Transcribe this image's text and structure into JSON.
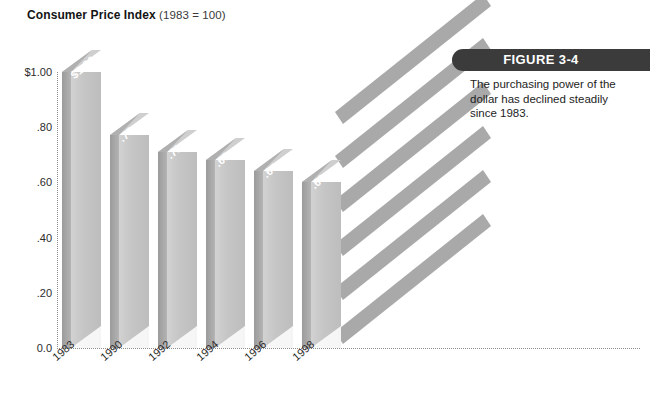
{
  "title": {
    "main": "Consumer Price Index",
    "sub": "(1983 = 100)"
  },
  "figure": {
    "banner_label": "FIGURE 3-4",
    "caption": "The purchasing power of the dollar has declined steadily since 1983.",
    "banner_color": "#3b3b3b"
  },
  "chart_data": {
    "type": "bar",
    "title": "Consumer Price Index (1983 = 100)",
    "xlabel": "",
    "ylabel": "",
    "categories": [
      "1983",
      "1990",
      "1992",
      "1994",
      "1996",
      "1998"
    ],
    "values": [
      1.0,
      0.77,
      0.71,
      0.68,
      0.64,
      0.6
    ],
    "value_labels": [
      "$1.00",
      ".77",
      ".71",
      ".68",
      ".64",
      ".60"
    ],
    "ylim": [
      0.0,
      1.0
    ],
    "yticks": [
      0.0,
      0.2,
      0.4,
      0.6,
      0.8,
      1.0
    ],
    "ytick_labels": [
      "0.0",
      ".20",
      ".40",
      ".60",
      ".80",
      "$1.00"
    ],
    "grid": "dotted-axes-only",
    "legend": "none",
    "bar_color": "#c6c6c6",
    "bar_side_color": "#a8a8a8",
    "style": "3d-slab-with-perspective-stripes",
    "stripe_count": 6,
    "annotation": "The purchasing power of the dollar has declined steadily since 1983."
  },
  "axes": {
    "y_ticks": [
      {
        "label": "$1.00",
        "value": 1.0
      },
      {
        "label": ".80",
        "value": 0.8
      },
      {
        "label": ".60",
        "value": 0.6
      },
      {
        "label": ".40",
        "value": 0.4
      },
      {
        "label": ".20",
        "value": 0.2
      },
      {
        "label": "0.0",
        "value": 0.0
      }
    ],
    "x_ticks": [
      "1983",
      "1990",
      "1992",
      "1994",
      "1996",
      "1998"
    ]
  }
}
